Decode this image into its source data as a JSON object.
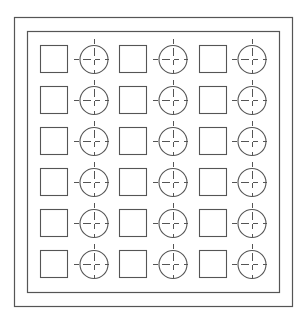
{
  "diagram": {
    "type": "grid-layout-drawing",
    "stroke_color": "#555555",
    "background": "#ffffff",
    "outer_frame": {
      "x": 14,
      "y": 17,
      "width": 278,
      "height": 289
    },
    "inner_frame": {
      "x": 27,
      "y": 31,
      "width": 252,
      "height": 261
    },
    "rows": 6,
    "columns_pairs": 3,
    "square_size": 27,
    "circle_radius": 14,
    "square_x": [
      40,
      119,
      199
    ],
    "circle_cx": [
      94,
      173,
      252
    ],
    "row_top_y": [
      45,
      86,
      127,
      168,
      209,
      250
    ],
    "circle_cy": [
      59,
      100,
      141,
      182,
      223,
      264
    ],
    "element_symbols": [
      "square",
      "crosshair-circle"
    ]
  }
}
